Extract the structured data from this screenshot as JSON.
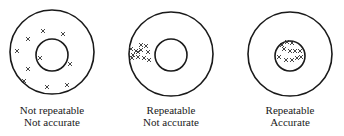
{
  "diagram": {
    "stroke_color": "#1a1a1a",
    "mark_color": "#333333",
    "targets": [
      {
        "id": "target-1",
        "outer": {
          "cx": 52,
          "cy": 52,
          "r": 42
        },
        "inner": {
          "cx": 52,
          "cy": 55,
          "r": 16
        },
        "label_line1": "Not repeatable",
        "label_line2": "Not accurate",
        "marks": [
          [
            43,
            31
          ],
          [
            28,
            39
          ],
          [
            63,
            34
          ],
          [
            17,
            51
          ],
          [
            40,
            58
          ],
          [
            70,
            64
          ],
          [
            28,
            69
          ],
          [
            24,
            81
          ],
          [
            47,
            87
          ],
          [
            67,
            85
          ]
        ]
      },
      {
        "id": "target-2",
        "outer": {
          "cx": 171,
          "cy": 54,
          "r": 42
        },
        "inner": {
          "cx": 171,
          "cy": 55,
          "r": 16
        },
        "label_line1": "Repeatable",
        "label_line2": "Not accurate",
        "marks": [
          [
            141,
            45
          ],
          [
            146,
            46
          ],
          [
            131,
            49
          ],
          [
            136,
            51
          ],
          [
            141,
            50
          ],
          [
            148,
            52
          ],
          [
            133,
            55
          ],
          [
            138,
            57
          ],
          [
            144,
            58
          ],
          [
            149,
            60
          ],
          [
            132,
            58
          ],
          [
            138,
            52
          ]
        ]
      },
      {
        "id": "target-3",
        "outer": {
          "cx": 290,
          "cy": 54,
          "r": 42
        },
        "inner": {
          "cx": 290,
          "cy": 56,
          "r": 15
        },
        "label_line1": "Repeatable",
        "label_line2": "Accurate",
        "marks": [
          [
            282,
            45
          ],
          [
            287,
            42
          ],
          [
            292,
            43
          ],
          [
            284,
            49
          ],
          [
            290,
            51
          ],
          [
            295,
            51
          ],
          [
            300,
            51
          ],
          [
            279,
            57
          ],
          [
            286,
            60
          ],
          [
            292,
            60
          ],
          [
            297,
            58
          ],
          [
            301,
            57
          ]
        ]
      }
    ]
  }
}
